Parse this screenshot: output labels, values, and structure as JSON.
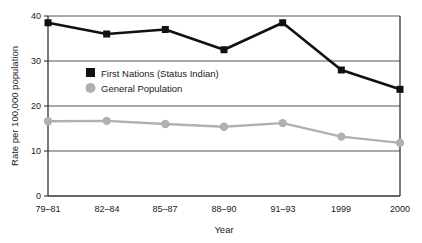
{
  "chart_data": {
    "type": "line",
    "title": "",
    "subtitle": "",
    "xlabel": "Year",
    "ylabel": "Rate per 100,000 population",
    "categories": [
      "79–81",
      "82–84",
      "85–87",
      "88–90",
      "91–93",
      "1999",
      "2000"
    ],
    "series": [
      {
        "name": "First Nations (Status Indian)",
        "values": [
          38.5,
          36.0,
          37.0,
          32.5,
          38.5,
          28.0,
          23.7
        ],
        "color": "#111111",
        "marker": "square"
      },
      {
        "name": "General Population",
        "values": [
          16.6,
          16.7,
          16.0,
          15.4,
          16.2,
          13.2,
          11.8
        ],
        "color": "#b0b0b0",
        "marker": "circle"
      }
    ],
    "ylim": [
      0,
      40
    ],
    "yticks": [
      0,
      10,
      20,
      30,
      40
    ],
    "ytick_labels": [
      "0",
      "10",
      "20",
      "30",
      "40"
    ],
    "grid": true,
    "grid_axis": "y",
    "legend_position": "upper-left-inside"
  },
  "axes": {
    "y_title": "Rate per 100,000 population",
    "x_title": "Year",
    "y_tick_labels": [
      "40",
      "30",
      "20",
      "10",
      "0"
    ],
    "x_tick_labels": [
      "79–81",
      "82–84",
      "85–87",
      "88–90",
      "91–93",
      "1999",
      "2000"
    ]
  },
  "legend": {
    "items": [
      {
        "label": "First Nations (Status Indian)",
        "marker": "black-square-marker",
        "color": "#111111"
      },
      {
        "label": "General Population",
        "marker": "gray-circle-marker",
        "color": "#b0b0b0"
      }
    ]
  },
  "colors": {
    "background": "#ffffff",
    "axis": "#333333",
    "grid": "#555555",
    "series_primary": "#111111",
    "series_secondary": "#b0b0b0"
  }
}
